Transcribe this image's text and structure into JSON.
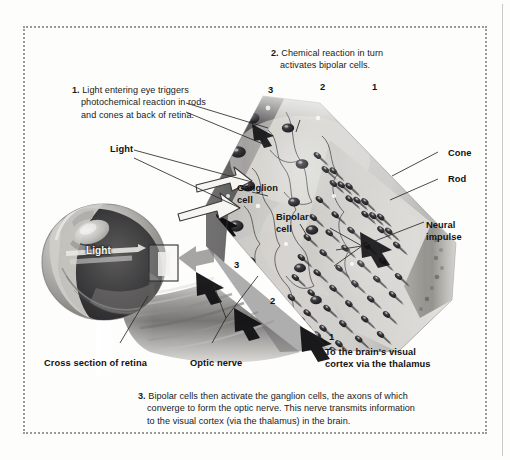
{
  "figure": {
    "background_color": "#fdfdfc",
    "frame_color": "#9a9a9a"
  },
  "steps": [
    {
      "id": "step-1",
      "number": "1.",
      "text": "Light entering eye triggers photochemical reaction in rods and cones at back of retina.",
      "lines": [
        "Light entering eye triggers",
        "photochemical reaction in rods",
        "and cones at back of retina."
      ]
    },
    {
      "id": "step-2",
      "number": "2.",
      "text": "Chemical reaction in turn activates bipolar cells.",
      "lines": [
        "Chemical reaction in turn",
        "activates bipolar cells."
      ]
    },
    {
      "id": "step-3",
      "number": "3.",
      "text": "Bipolar cells then activate the ganglion cells, the axons of which converge to form the optic nerve. This nerve transmits information to the visual cortex (via the thalamus) in the brain.",
      "lines": [
        "Bipolar cells then activate the ganglion cells, the axons of which",
        "converge to form the optic nerve. This nerve transmits information",
        "to the visual cortex (via the thalamus) in the brain."
      ]
    }
  ],
  "step_markers_top": [
    {
      "label": "3"
    },
    {
      "label": "2"
    },
    {
      "label": "1"
    }
  ],
  "step_markers_lower": [
    {
      "label": "3"
    },
    {
      "label": "2"
    },
    {
      "label": "1"
    }
  ],
  "labels": {
    "light_ray": "Light",
    "light_in_eye": "Light",
    "ganglion_cell": "Ganglion\ncell",
    "ganglion_cell_line1": "Ganglion",
    "ganglion_cell_line2": "cell",
    "bipolar_cell_line1": "Bipolar",
    "bipolar_cell_line2": "cell",
    "cone": "Cone",
    "rod": "Rod",
    "neural_impulse_line1": "Neural",
    "neural_impulse_line2": "impulse",
    "cross_section": "Cross section of retina",
    "optic_nerve": "Optic nerve",
    "to_brain_line1": "To the brain's visual",
    "to_brain_line2": "cortex via the thalamus"
  },
  "colors": {
    "text": "#1a1a1a",
    "label_bold": "#121212",
    "frame": "#9a9a9a",
    "rule": "#c9c9c9",
    "tissue_light": "#d7d6d2",
    "tissue_mid": "#a9a8a4",
    "tissue_dark": "#58575a",
    "cell_dark": "#2a2a2e",
    "arrow": "#111111",
    "leader": "#2a2a2a"
  }
}
